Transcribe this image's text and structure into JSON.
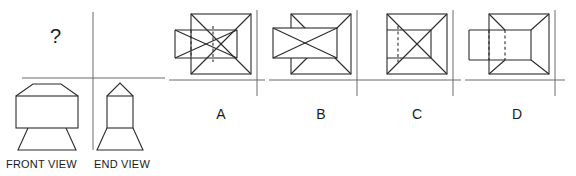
{
  "figure": {
    "type": "orthographic-projection-question",
    "background_color": "#ffffff",
    "line_color": "#2b2b2b",
    "axis_color": "#6a6a6a"
  },
  "given_panel": {
    "question_mark": "?",
    "front_view_caption": "FRONT VIEW",
    "end_view_caption": "END VIEW",
    "projection_axes": {
      "horizontal_line_y": 78,
      "horizontal_line_x1": 22,
      "horizontal_line_x2": 165,
      "vertical_line_x": 93,
      "vertical_line_y1": 12,
      "vertical_line_y2": 150
    },
    "front_view": {
      "description": "hipped-roof block over a flaring trapezoidal base",
      "body_left": 16,
      "body_right": 78,
      "body_top": 96,
      "body_bottom": 128,
      "apex_x": 47,
      "apex_y": 84,
      "ridge_left": 30,
      "ridge_right": 64,
      "base_bottom_left": 26,
      "base_bottom_right": 70,
      "base_bottom_y": 150
    },
    "end_view": {
      "description": "narrow gabled block over a flaring trapezoidal base",
      "body_left": 107,
      "body_right": 133,
      "body_top": 96,
      "body_bottom": 128,
      "apex_x": 120,
      "apex_y": 84,
      "base_bottom_left": 98,
      "base_bottom_right": 142,
      "base_bottom_y": 150
    }
  },
  "options": [
    {
      "id": "a",
      "label": "A",
      "description": "square plan with full X diagonals plus a wider rectangle crossing the left edge, hidden edges dashed",
      "square": {
        "left": 22,
        "top": 14,
        "size": 60
      },
      "inner_rect": {
        "left": 6,
        "top": 30,
        "width": 62,
        "height": 28
      },
      "diagonals": "full-x",
      "hidden_lines": "two vertical dashed lines inside the overlap",
      "protrudes_left": true,
      "dashed": true
    },
    {
      "id": "b",
      "label": "B",
      "description": "square plan with full X diagonals plus a wider rectangle crossing the left edge, all edges solid with its own X",
      "square": {
        "left": 22,
        "top": 14,
        "size": 60
      },
      "inner_rect": {
        "left": 4,
        "top": 28,
        "width": 64,
        "height": 30
      },
      "diagonals": "full-x",
      "hidden_lines": "none, rectangle drawn solid on top",
      "protrudes_left": true,
      "dashed": false
    },
    {
      "id": "c",
      "label": "C",
      "description": "square plan with full X diagonals and a smaller inner rectangle fully contained, one dashed vertical line",
      "square": {
        "left": 22,
        "top": 14,
        "size": 60
      },
      "inner_rect": {
        "left": 24,
        "top": 30,
        "width": 42,
        "height": 28
      },
      "diagonals": "full-x",
      "hidden_lines": "single short vertical dashed line at left of the inner rectangle",
      "protrudes_left": false,
      "dashed": true
    },
    {
      "id": "d",
      "label": "D",
      "description": "square plan with frustum corner lines (no crossing X) plus a rectangle protruding left, two dashed vertical hidden lines",
      "square": {
        "left": 24,
        "top": 14,
        "size": 60
      },
      "inner_rect": {
        "left": 4,
        "top": 30,
        "width": 62,
        "height": 30
      },
      "diagonals": "frustum-corners",
      "hidden_lines": "two vertical dashed lines inside the overlap",
      "protrudes_left": true,
      "dashed": true
    }
  ],
  "option_axes": {
    "horizontal_line_y": 80,
    "vertical_line_y1": 10,
    "vertical_line_y2": 96
  }
}
